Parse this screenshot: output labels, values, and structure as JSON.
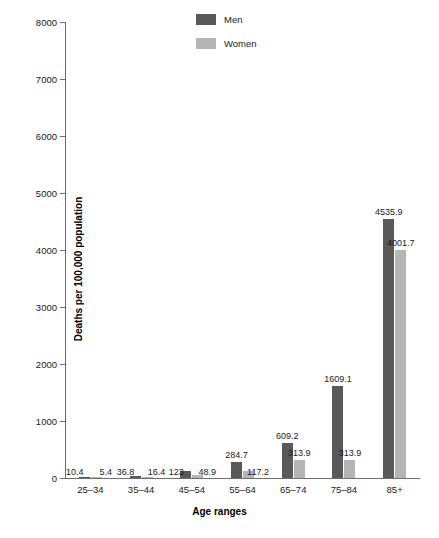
{
  "chart_data": {
    "type": "bar",
    "title": "",
    "xlabel": "Age ranges",
    "ylabel": "Deaths per 100,000 population",
    "categories": [
      "25–34",
      "35–44",
      "45–54",
      "55–64",
      "65–74",
      "75–84",
      "85+"
    ],
    "series": [
      {
        "name": "Men",
        "color": "#595959",
        "values": [
          10.4,
          36.8,
          123,
          284.7,
          609.2,
          1609.1,
          4535.9
        ],
        "value_labels": [
          "10.4",
          "36.8",
          "123",
          "284.7",
          "609.2",
          "1609.1",
          "4535.9"
        ]
      },
      {
        "name": "Women",
        "color": "#b5b5b5",
        "values": [
          5.4,
          16.4,
          48.9,
          117.2,
          313.9,
          313.9,
          4001.7
        ],
        "value_labels": [
          "5.4",
          "16.4",
          "48.9",
          "117.2",
          "313.9",
          "313.9",
          "4001.7"
        ]
      }
    ],
    "ylim": [
      0,
      8000
    ],
    "yticks": [
      0,
      1000,
      2000,
      3000,
      4000,
      5000,
      6000,
      7000,
      8000
    ],
    "ytick_labels": [
      "0",
      "1000",
      "2000",
      "3000",
      "4000",
      "5000",
      "6000",
      "7000",
      "8000"
    ],
    "grid": false,
    "legend_position": "top-center"
  }
}
